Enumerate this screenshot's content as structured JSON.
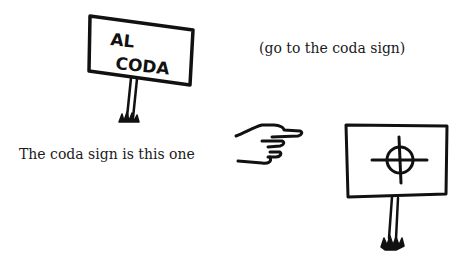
{
  "signs": {
    "al_coda": {
      "line1": "AL",
      "line2": "CODA"
    },
    "coda": {
      "symbol": "coda-symbol"
    }
  },
  "captions": {
    "explanation": "(go to the coda sign)",
    "pointer": "The coda sign is this one"
  },
  "icons": {
    "pointing_hand": "pointing-hand-icon"
  },
  "colors": {
    "ink": "#111111",
    "background": "#ffffff"
  }
}
